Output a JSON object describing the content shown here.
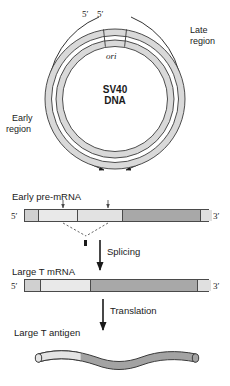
{
  "figure": {
    "colors": {
      "ring_fill": "#d8d8d8",
      "ring_stroke": "#333333",
      "bar_light": "#e8e8e8",
      "bar_mid": "#cfcfcf",
      "bar_dark": "#a0a0a0",
      "line": "#1a1a1a",
      "background": "#ffffff"
    }
  },
  "circle": {
    "center_line1": "SV40",
    "center_line2": "DNA",
    "ori_label": "ori",
    "five_prime_left": "5′",
    "five_prime_right": "5′",
    "late_region_line1": "Late",
    "late_region_line2": "region",
    "early_region_line1": "Early",
    "early_region_line2": "region"
  },
  "rows": {
    "pre_mrna": {
      "label": "Early pre-mRNA",
      "five_prime": "5′",
      "three_prime": "3′",
      "segments": [
        {
          "name": "cap-segment",
          "width_pct": 7,
          "shade": "#d0d0d0"
        },
        {
          "name": "exon1",
          "width_pct": 21,
          "shade": "#e9e9e9"
        },
        {
          "name": "intron",
          "width_pct": 24,
          "shade": "#e2e2e2"
        },
        {
          "name": "exon2-coding",
          "width_pct": 42,
          "shade": "#a8a8a8"
        },
        {
          "name": "tail-segment",
          "width_pct": 6,
          "shade": "#e0e0e0"
        }
      ]
    },
    "splicing": {
      "label": "Splicing"
    },
    "mrna": {
      "label": "Large T mRNA",
      "five_prime": "5′",
      "three_prime": "3′",
      "segments": [
        {
          "name": "cap-segment",
          "width_pct": 8,
          "shade": "#d0d0d0"
        },
        {
          "name": "exon1",
          "width_pct": 27,
          "shade": "#e9e9e9"
        },
        {
          "name": "coding",
          "width_pct": 58,
          "shade": "#a8a8a8"
        },
        {
          "name": "tail-segment",
          "width_pct": 7,
          "shade": "#e0e0e0"
        }
      ]
    },
    "translation": {
      "label": "Translation"
    },
    "protein": {
      "label": "Large T antigen",
      "light_fraction_pct": 27
    }
  }
}
